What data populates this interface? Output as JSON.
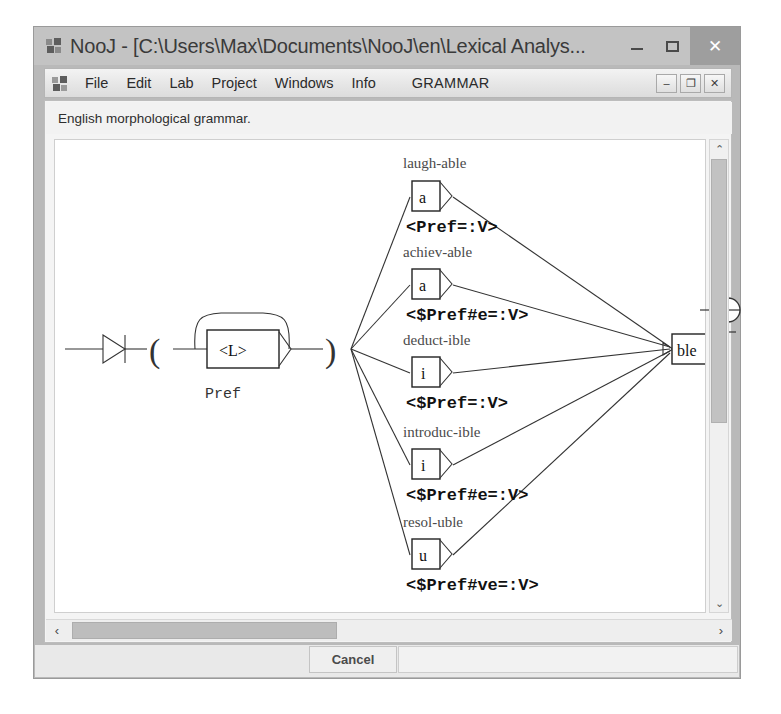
{
  "window": {
    "title": "NooJ - [C:\\Users\\Max\\Documents\\NooJ\\en\\Lexical Analys...",
    "title_icon": "nooj-app-icon",
    "minimize_label": "–",
    "maximize_label": "□",
    "close_label": "✕"
  },
  "menu": {
    "icon": "nooj-document-icon",
    "items": [
      {
        "label": "File"
      },
      {
        "label": "Edit"
      },
      {
        "label": "Lab"
      },
      {
        "label": "Project"
      },
      {
        "label": "Windows"
      },
      {
        "label": "Info"
      },
      {
        "label": "GRAMMAR"
      }
    ],
    "mdi_minimize": "–",
    "mdi_restore": "❐",
    "mdi_close": "✕"
  },
  "document": {
    "status_text": "English morphological grammar."
  },
  "scrollbars": {
    "v_up": "⌃",
    "v_down": "⌄",
    "h_left": "‹",
    "h_right": "›"
  },
  "footer": {
    "cancel_label": "Cancel"
  },
  "graph": {
    "start_label": "Pref",
    "epsilon_box": "<L>",
    "suffix_box": "ble",
    "branches": [
      {
        "example": "laugh-able",
        "letter": "a",
        "constraint": "<Pref=:V>"
      },
      {
        "example": "achiev-able",
        "letter": "a",
        "constraint": "<$Pref#e=:V>"
      },
      {
        "example": "deduct-ible",
        "letter": "i",
        "constraint": "<$Pref=:V>"
      },
      {
        "example": "introduc-ible",
        "letter": "i",
        "constraint": "<$Pref#e=:V>"
      },
      {
        "example": "resol-uble",
        "letter": "u",
        "constraint": "<$Pref#ve=:V>"
      }
    ]
  },
  "colors": {
    "window_chrome": "#c3c3c3",
    "menu_bg": "#e6e6e6",
    "canvas_bg": "#ffffff",
    "close_button": "#9e9e9e",
    "graph_ink": "#333333"
  }
}
